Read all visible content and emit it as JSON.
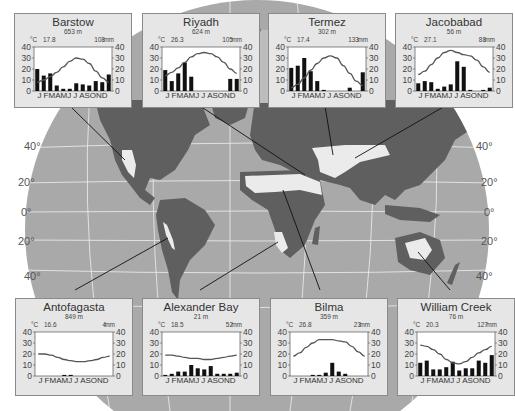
{
  "figure": {
    "latitude_labels_left": [
      "40°",
      "20°",
      "0°",
      "20°",
      "40°"
    ],
    "latitude_labels_right": [
      "40°",
      "20°",
      "0°",
      "20°",
      "40°"
    ],
    "meridian_label": "0°"
  },
  "chart_data": [
    {
      "type": "bar+line",
      "title": "Barstow",
      "elevation": "653 m",
      "mean_temp_c": "17.8",
      "annual_precip_mm": "108",
      "temp_unit": "°C",
      "precip_unit": "mm",
      "categories": [
        "J",
        "F",
        "M",
        "A",
        "M",
        "J",
        "J",
        "A",
        "S",
        "O",
        "N",
        "D"
      ],
      "precip": [
        20,
        14,
        16,
        5,
        2,
        2,
        7,
        6,
        5,
        9,
        8,
        15
      ],
      "temp": [
        8,
        10,
        13,
        17,
        22,
        27,
        30,
        29,
        25,
        18,
        12,
        8
      ],
      "ylim": [
        0,
        40
      ],
      "yticks": [
        0,
        10,
        20,
        30,
        40
      ]
    },
    {
      "type": "bar+line",
      "title": "Riyadh",
      "elevation": "624 m",
      "mean_temp_c": "26.3",
      "annual_precip_mm": "105",
      "temp_unit": "°C",
      "precip_unit": "mm",
      "categories": [
        "J",
        "F",
        "M",
        "A",
        "M",
        "J",
        "J",
        "A",
        "S",
        "O",
        "N",
        "D"
      ],
      "precip": [
        19,
        9,
        16,
        26,
        13,
        0,
        0,
        0,
        0,
        0,
        11,
        11
      ],
      "temp": [
        14,
        17,
        21,
        26,
        31,
        34,
        35,
        34,
        31,
        26,
        20,
        16
      ],
      "ylim": [
        0,
        40
      ],
      "yticks": [
        0,
        10,
        20,
        30,
        40
      ]
    },
    {
      "type": "bar+line",
      "title": "Termez",
      "elevation": "302 m",
      "mean_temp_c": "17.4",
      "annual_precip_mm": "133",
      "temp_unit": "°C",
      "precip_unit": "mm",
      "categories": [
        "J",
        "F",
        "M",
        "A",
        "M",
        "J",
        "J",
        "A",
        "S",
        "O",
        "N",
        "D"
      ],
      "precip": [
        21,
        23,
        30,
        18,
        9,
        1,
        0,
        0,
        0,
        3,
        0,
        17
      ],
      "temp": [
        3,
        6,
        12,
        19,
        25,
        30,
        32,
        30,
        23,
        16,
        9,
        5
      ],
      "ylim": [
        0,
        40
      ],
      "yticks": [
        0,
        10,
        20,
        30,
        40
      ]
    },
    {
      "type": "bar+line",
      "title": "Jacobabad",
      "elevation": "56 m",
      "mean_temp_c": "27.1",
      "annual_precip_mm": "88",
      "temp_unit": "°C",
      "precip_unit": "mm",
      "categories": [
        "J",
        "F",
        "M",
        "A",
        "M",
        "J",
        "J",
        "A",
        "S",
        "O",
        "N",
        "D"
      ],
      "precip": [
        7,
        9,
        8,
        2,
        4,
        6,
        27,
        22,
        1,
        0,
        1,
        3
      ],
      "temp": [
        15,
        18,
        24,
        30,
        35,
        37,
        35,
        33,
        32,
        28,
        22,
        17
      ],
      "ylim": [
        0,
        40
      ],
      "yticks": [
        0,
        10,
        20,
        30,
        40
      ]
    },
    {
      "type": "bar+line",
      "title": "Antofagasta",
      "elevation": "849 m",
      "mean_temp_c": "16.6",
      "annual_precip_mm": "4",
      "temp_unit": "°C",
      "precip_unit": "mm",
      "categories": [
        "J",
        "F",
        "M",
        "A",
        "M",
        "J",
        "J",
        "A",
        "S",
        "O",
        "N",
        "D"
      ],
      "precip": [
        0,
        0,
        0,
        0,
        1,
        1,
        0,
        0,
        0,
        0,
        0,
        0
      ],
      "temp": [
        20,
        20,
        19,
        17,
        15,
        14,
        13,
        13,
        14,
        15,
        17,
        18
      ],
      "ylim": [
        0,
        40
      ],
      "yticks": [
        0,
        10,
        20,
        30,
        40
      ]
    },
    {
      "type": "bar+line",
      "title": "Alexander Bay",
      "elevation": "21 m",
      "mean_temp_c": "18.5",
      "annual_precip_mm": "52",
      "temp_unit": "°C",
      "precip_unit": "mm",
      "categories": [
        "J",
        "F",
        "M",
        "A",
        "M",
        "J",
        "J",
        "A",
        "S",
        "O",
        "N",
        "D"
      ],
      "precip": [
        1,
        2,
        4,
        4,
        10,
        7,
        6,
        9,
        2,
        2,
        2,
        3
      ],
      "temp": [
        19,
        19,
        18,
        17,
        16,
        16,
        15,
        15,
        16,
        17,
        18,
        19
      ],
      "ylim": [
        0,
        40
      ],
      "yticks": [
        0,
        10,
        20,
        30,
        40
      ]
    },
    {
      "type": "bar+line",
      "title": "Bilma",
      "elevation": "359 m",
      "mean_temp_c": "26.8",
      "annual_precip_mm": "23",
      "temp_unit": "°C",
      "precip_unit": "mm",
      "categories": [
        "J",
        "F",
        "M",
        "A",
        "M",
        "J",
        "J",
        "A",
        "S",
        "O",
        "N",
        "D"
      ],
      "precip": [
        0,
        0,
        0,
        1,
        1,
        3,
        12,
        4,
        2,
        0,
        0,
        0
      ],
      "temp": [
        18,
        21,
        26,
        30,
        33,
        33,
        33,
        32,
        31,
        27,
        22,
        18
      ],
      "ylim": [
        0,
        40
      ],
      "yticks": [
        0,
        10,
        20,
        30,
        40
      ]
    },
    {
      "type": "bar+line",
      "title": "William Creek",
      "elevation": "76 m",
      "mean_temp_c": "20.3",
      "annual_precip_mm": "127",
      "temp_unit": "°C",
      "precip_unit": "mm",
      "categories": [
        "J",
        "F",
        "M",
        "A",
        "M",
        "J",
        "J",
        "A",
        "S",
        "O",
        "N",
        "D"
      ],
      "precip": [
        12,
        14,
        6,
        6,
        8,
        13,
        5,
        7,
        7,
        14,
        12,
        19
      ],
      "temp": [
        28,
        27,
        24,
        20,
        15,
        12,
        11,
        13,
        17,
        21,
        24,
        27
      ],
      "ylim": [
        0,
        40
      ],
      "yticks": [
        0,
        10,
        20,
        30,
        40
      ]
    }
  ],
  "month_axis_label": "J FMAMJ J ASOND",
  "colors": {
    "ocean": "#a9a9a9",
    "land": "#5f5f5f",
    "desert": "#ebebeb",
    "graticule": "#f2f2f2",
    "panel": "#e6e6e6",
    "bars": "#111111",
    "temp_line": "#555555"
  }
}
